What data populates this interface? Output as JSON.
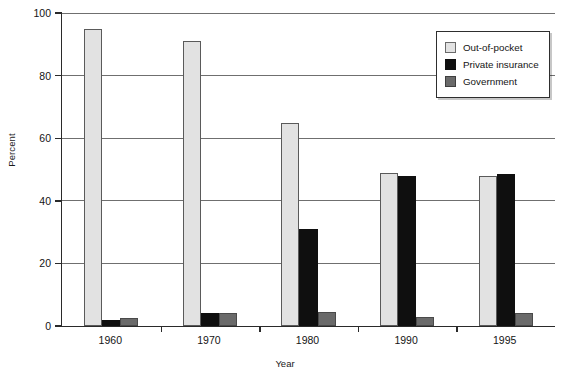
{
  "chart_data": {
    "type": "bar",
    "title": "",
    "subtitle": "",
    "xlabel": "Year",
    "ylabel": "Percent",
    "categories": [
      "1960",
      "1970",
      "1980",
      "1990",
      "1995"
    ],
    "series": [
      {
        "name": "Out-of-pocket",
        "color": "#e2e2e2",
        "values": [
          95,
          91,
          65,
          49,
          48
        ]
      },
      {
        "name": "Private insurance",
        "color": "#0f0f0f",
        "values": [
          2,
          4,
          31,
          48,
          48.5
        ]
      },
      {
        "name": "Government",
        "color": "#6a6a6a",
        "values": [
          2.5,
          4.3,
          4.5,
          3,
          4
        ]
      }
    ],
    "ylim": [
      0,
      100
    ],
    "yticks": [
      0,
      20,
      40,
      60,
      80,
      100
    ],
    "ytick_labels": [
      "0",
      "20",
      "40",
      "60",
      "80",
      "100"
    ],
    "grid": true,
    "grid_axis": "y",
    "legend_position": "top-right",
    "bar_group_gap": 0.45
  }
}
